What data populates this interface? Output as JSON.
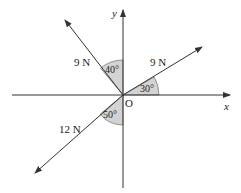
{
  "diagram": {
    "type": "force-vector-diagram",
    "axes": {
      "x_label": "x",
      "y_label": "y",
      "origin_label": "O"
    },
    "forces": [
      {
        "magnitude_label": "9 N",
        "angle_label": "30°",
        "angle_reference": "positive x-axis",
        "direction": "up-right"
      },
      {
        "magnitude_label": "9 N",
        "angle_label": "40°",
        "angle_reference": "positive y-axis",
        "direction": "up-left"
      },
      {
        "magnitude_label": "12 N",
        "angle_label": "50°",
        "angle_reference": "negative y-axis",
        "direction": "down-left"
      }
    ],
    "colors": {
      "line": "#333333",
      "angle_fill": "#d3d3d3"
    }
  }
}
